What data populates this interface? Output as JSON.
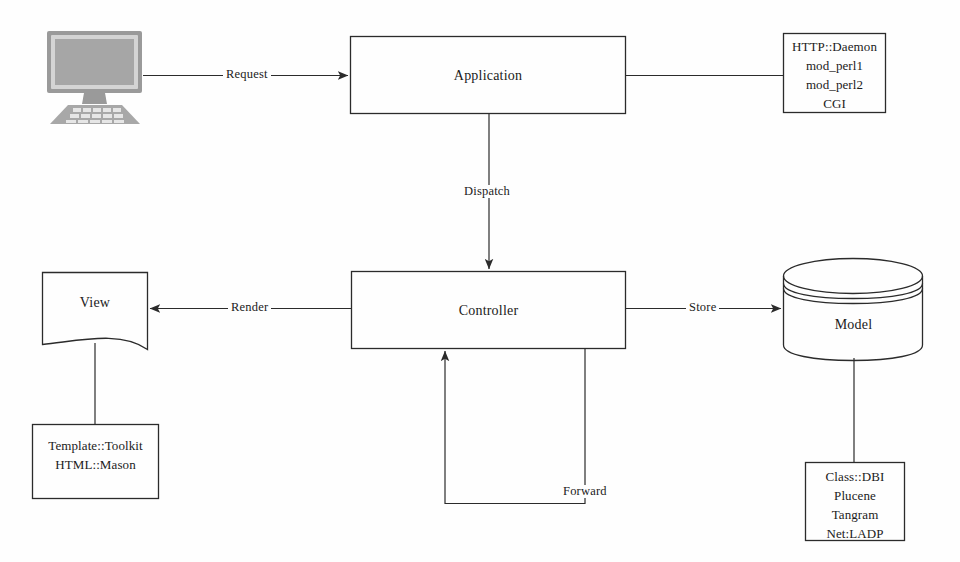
{
  "diagram": {
    "type": "flow-diagram",
    "stroke_color": "#2b2b2b",
    "text_color": "#1b1b1b",
    "background_color": "#fefefe",
    "monitor_fill": "#a8a8a8",
    "nodes": {
      "client": {
        "label": "",
        "shape": "computer-monitor-icon"
      },
      "application": {
        "label": "Application",
        "shape": "rectangle"
      },
      "server_stack": {
        "shape": "rectangle",
        "lines": [
          "HTTP::Daemon",
          "mod_perl1",
          "mod_perl2",
          "CGI"
        ]
      },
      "controller": {
        "label": "Controller",
        "shape": "rectangle"
      },
      "view": {
        "label": "View",
        "shape": "document"
      },
      "model": {
        "label": "Model",
        "shape": "cylinder"
      },
      "view_stack": {
        "shape": "rectangle",
        "lines": [
          "Template::Toolkit",
          "HTML::Mason"
        ]
      },
      "model_stack": {
        "shape": "rectangle",
        "lines": [
          "Class::DBI",
          "Plucene",
          "Tangram",
          "Net:LADP"
        ]
      }
    },
    "edges": [
      {
        "id": "request",
        "label": "Request",
        "from": "client",
        "to": "application",
        "arrow": true
      },
      {
        "id": "serverlink",
        "label": "",
        "from": "application",
        "to": "server_stack",
        "arrow": false
      },
      {
        "id": "dispatch",
        "label": "Dispatch",
        "from": "application",
        "to": "controller",
        "arrow": true
      },
      {
        "id": "render",
        "label": "Render",
        "from": "controller",
        "to": "view",
        "arrow": true
      },
      {
        "id": "store",
        "label": "Store",
        "from": "controller",
        "to": "model",
        "arrow": true
      },
      {
        "id": "forward",
        "label": "Forward",
        "from": "controller",
        "to": "controller",
        "arrow": true
      },
      {
        "id": "viewlink",
        "label": "",
        "from": "view",
        "to": "view_stack",
        "arrow": false
      },
      {
        "id": "modellink",
        "label": "",
        "from": "model",
        "to": "model_stack",
        "arrow": false
      }
    ]
  }
}
